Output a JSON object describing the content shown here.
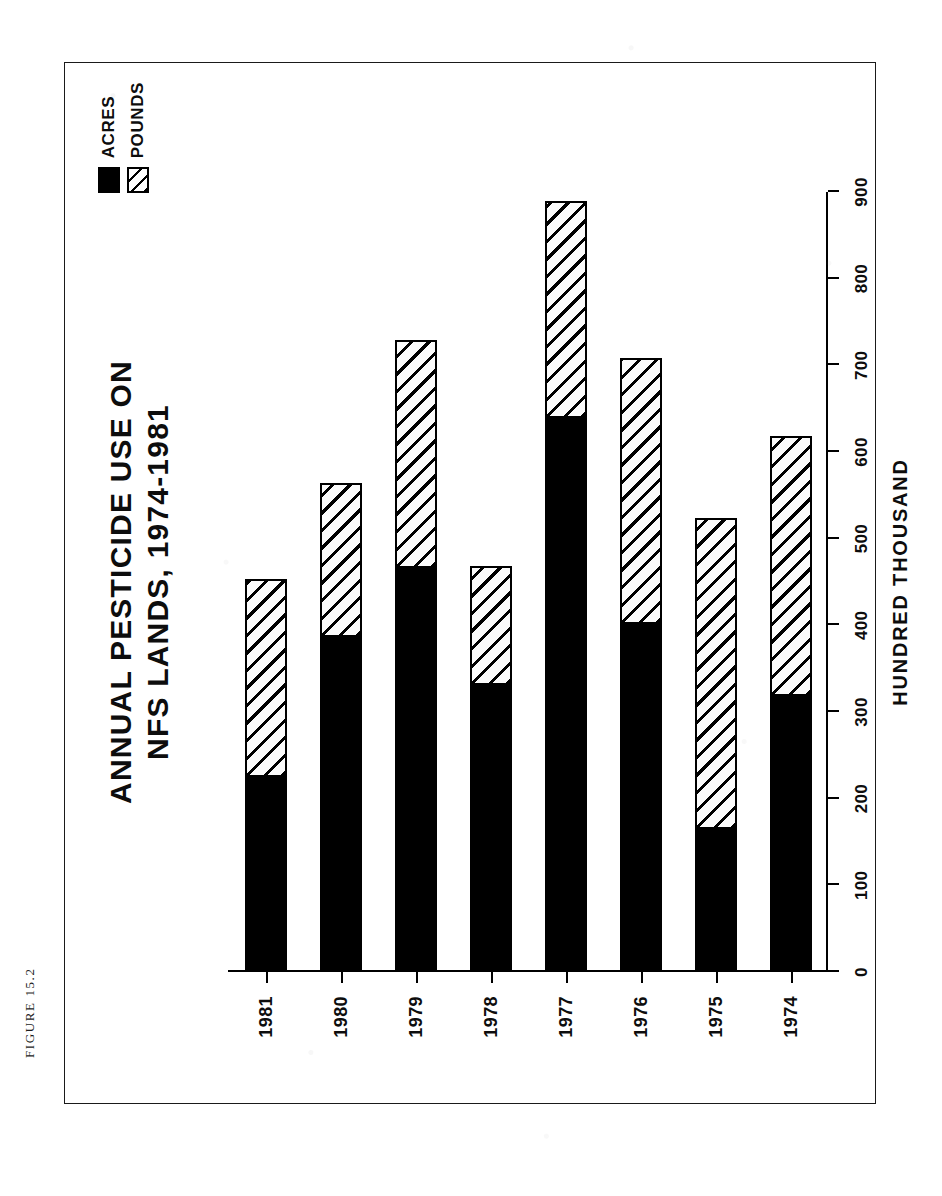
{
  "figure": {
    "caption": "FIGURE 15.2"
  },
  "chart_data": {
    "type": "bar",
    "orientation": "horizontal-stacked",
    "title": "ANNUAL PESTICIDE USE ON NFS LANDS, 1974-1981",
    "title_lines": [
      "ANNUAL PESTICIDE USE ON",
      "NFS LANDS, 1974-1981"
    ],
    "xlabel": "HUNDRED THOUSAND",
    "ylabel": "",
    "categories": [
      "1974",
      "1975",
      "1976",
      "1977",
      "1978",
      "1979",
      "1980",
      "1981"
    ],
    "xlim": [
      0,
      900
    ],
    "xticks": [
      0,
      100,
      200,
      300,
      400,
      500,
      600,
      700,
      800,
      900
    ],
    "xtick_labels": [
      "0",
      "100",
      "200",
      "300",
      "400",
      "500",
      "600",
      "700",
      "800",
      "900"
    ],
    "grid": false,
    "legend_position": "top-right",
    "series": [
      {
        "name": "ACRES",
        "fill": "solid-black",
        "values": [
          318,
          165,
          402,
          639,
          331,
          466,
          386,
          225
        ]
      },
      {
        "name": "POUNDS",
        "fill": "diagonal-hatch",
        "values": [
          301,
          359,
          307,
          251,
          137,
          263,
          178,
          229
        ]
      }
    ],
    "totals": [
      619,
      524,
      709,
      890,
      468,
      729,
      564,
      454
    ]
  },
  "legend": {
    "items": [
      {
        "label": "ACRES",
        "swatch": "solid-black-swatch"
      },
      {
        "label": "POUNDS",
        "swatch": "hatched-swatch"
      }
    ]
  },
  "colors": {
    "ink": "#000000",
    "paper": "#ffffff",
    "acres": "#000000",
    "pounds_hatch": "#000000"
  }
}
